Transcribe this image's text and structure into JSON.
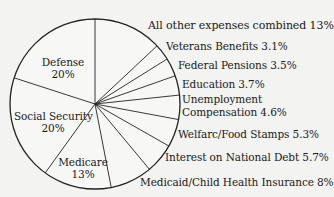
{
  "chart_data": {
    "type": "pie",
    "title": "",
    "start_angle_deg": 0,
    "direction": "clockwise-from-top",
    "slices": [
      {
        "label": "All other expenses combined",
        "value": 13,
        "display": "All other expenses combined 13%"
      },
      {
        "label": "Veterans Benefits",
        "value": 3.1,
        "display": "Veterans Benefits 3.1%"
      },
      {
        "label": "Federal Pensions",
        "value": 3.5,
        "display": "Federal Pensions 3.5%"
      },
      {
        "label": "Education",
        "value": 3.7,
        "display": "Education 3.7%"
      },
      {
        "label": "Unemployment Compensation",
        "value": 4.6,
        "display": "Unemployment Compensation 4.6%"
      },
      {
        "label": "Welfare/Food Stamps",
        "value": 5.3,
        "display": "Welfarc/Food Stamps 5.3%"
      },
      {
        "label": "Interest on National Debt",
        "value": 5.7,
        "display": "Interest on National Debt 5.7%"
      },
      {
        "label": "Medicaid/Child Health Insurance",
        "value": 8,
        "display": "Medicaid/Child Health Insurance 8%"
      },
      {
        "label": "Medicare",
        "value": 13,
        "display": "Medicare 13%"
      },
      {
        "label": "Social Security",
        "value": 20,
        "display": "Social Security 20%"
      },
      {
        "label": "Defense",
        "value": 20,
        "display": "Defense 20%"
      }
    ],
    "colors": {
      "fill": "#f7f7f5",
      "stroke": "#222222",
      "background": "#f3f3f1"
    },
    "legend": "none (labels placed beside slices)"
  },
  "labels": {
    "other": "All other expenses combined 13%",
    "veterans": "Veterans Benefits 3.1%",
    "pensions": "Federal Pensions 3.5%",
    "education": "Education 3.7%",
    "unemployment_line1": "Unemployment",
    "unemployment_line2": "Compensation 4.6%",
    "welfare": "Welfarc/Food Stamps 5.3%",
    "interest": "Interest on National Debt 5.7%",
    "medicaid": "Medicaid/Child Health Insurance 8%",
    "defense_name": "Defense",
    "defense_pct": "20%",
    "ss_name": "Social Security",
    "ss_pct": "20%",
    "medicare_name": "Medicare",
    "medicare_pct": "13%"
  }
}
